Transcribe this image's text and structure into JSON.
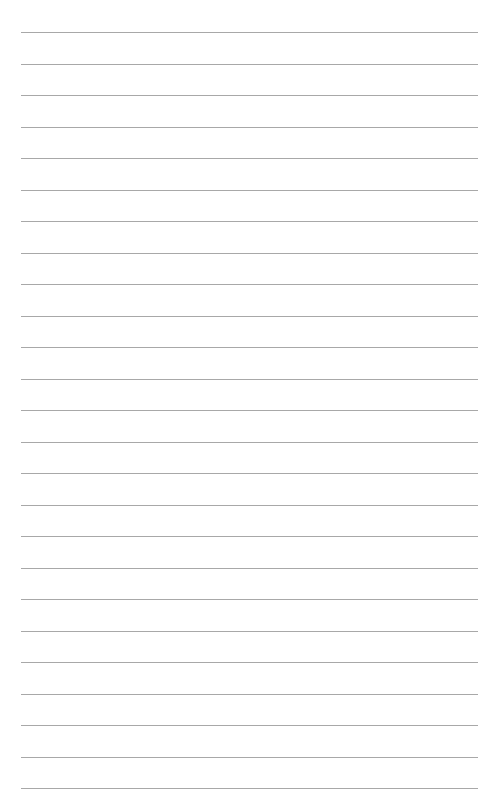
{
  "page": {
    "type": "lined-paper",
    "line_count": 25,
    "line_color": "#a8a8a8",
    "background": "#ffffff",
    "first_line_y": 32,
    "line_spacing": 31.5,
    "line_left": 21,
    "line_right": 478
  }
}
